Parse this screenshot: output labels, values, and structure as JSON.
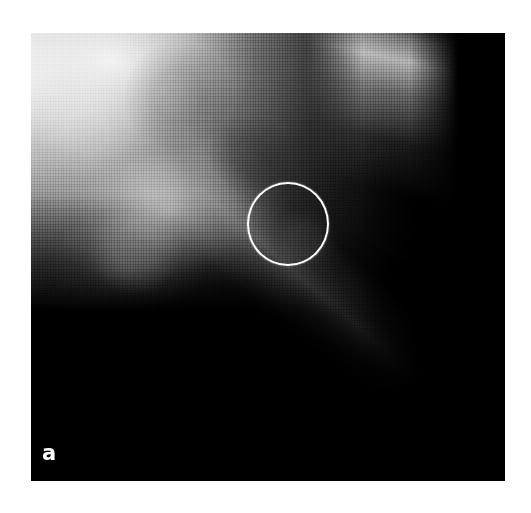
{
  "figure": {
    "panel_label": "a",
    "modality": "mammogram",
    "caption": "",
    "plate": {
      "left": 31,
      "top": 33,
      "width": 474,
      "height": 448,
      "background_color": "#000000",
      "page_background": "#ffffff"
    }
  },
  "annotations": [
    {
      "name": "lesion-marker-circle",
      "shape": "circle",
      "color": "#fdfdfd",
      "stroke_width": 2.4,
      "center_x": 288,
      "center_y": 224,
      "radius_x": 41,
      "radius_y": 42,
      "label": ""
    }
  ],
  "image_regions": [
    {
      "name": "fibroglandular-tissue-upper-left",
      "tone": "bright",
      "hex": "#f0f0f0"
    },
    {
      "name": "glandular-density-mid-left",
      "tone": "bright",
      "hex": "#d8d8d8"
    },
    {
      "name": "glandular-density-lower-left",
      "tone": "bright",
      "hex": "#cfcfcf"
    },
    {
      "name": "fibrous-band-diagonal",
      "tone": "bright",
      "hex": "#dcdcdc"
    },
    {
      "name": "retroglandular-shadow",
      "tone": "dark",
      "hex": "#3a3a3a"
    },
    {
      "name": "skin-line-chest-wall",
      "tone": "bright",
      "hex": "#c8c8c8"
    },
    {
      "name": "air-field-right",
      "tone": "black",
      "hex": "#000000"
    },
    {
      "name": "air-field-lower-right",
      "tone": "black",
      "hex": "#050505"
    }
  ],
  "label_style": {
    "color": "#ffffff",
    "weight": "bold",
    "size_px": 21
  }
}
